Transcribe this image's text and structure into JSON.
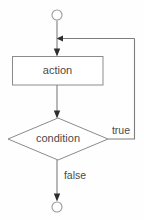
{
  "diagram": {
    "type": "flowchart",
    "background_color": "#fefefe",
    "line_color": "#7d7d7d",
    "shape_stroke_color": "#8b8b8b",
    "shape_fill_color": "#ffffff",
    "text_color": "#4a4a4a",
    "arrow_color": "#2e2e2e",
    "nodes": [
      {
        "id": "start",
        "shape": "circle",
        "label": "",
        "cx": 57,
        "cy": 15,
        "r": 5
      },
      {
        "id": "action",
        "shape": "rectangle",
        "label": "action",
        "x": 12,
        "y": 56,
        "width": 91,
        "height": 29
      },
      {
        "id": "condition",
        "shape": "diamond",
        "label": "condition",
        "cx": 58,
        "cy": 139,
        "half_width": 50,
        "half_height": 21
      },
      {
        "id": "end",
        "shape": "circle",
        "label": "",
        "cx": 57,
        "cy": 207,
        "r": 5
      }
    ],
    "edges": [
      {
        "id": "start-to-merge",
        "from": "start",
        "to": "merge-point",
        "label": "",
        "direction": "down"
      },
      {
        "id": "merge-to-action",
        "from": "merge-point",
        "to": "action",
        "label": "",
        "direction": "down"
      },
      {
        "id": "action-to-condition",
        "from": "action",
        "to": "condition",
        "label": "",
        "direction": "down"
      },
      {
        "id": "condition-true-loopback",
        "from": "condition",
        "to": "merge-point",
        "label": "true",
        "label_x": 121,
        "label_y": 131,
        "direction": "right-up-left"
      },
      {
        "id": "condition-false-to-end",
        "from": "condition",
        "to": "end",
        "label": "false",
        "label_x": 75,
        "label_y": 176,
        "direction": "down"
      }
    ]
  }
}
